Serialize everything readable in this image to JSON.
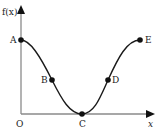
{
  "diagram": {
    "type": "function-graph",
    "y_axis_label": "f(x)",
    "x_axis_label": "x",
    "origin_label": "O",
    "curve_color": "#1a1a1a",
    "axis_color": "#777777",
    "points": [
      {
        "label": "A",
        "description": "maximum on y-axis"
      },
      {
        "label": "B",
        "description": "inflection point (decreasing)"
      },
      {
        "label": "C",
        "description": "minimum on x-axis"
      },
      {
        "label": "D",
        "description": "inflection point (increasing)"
      },
      {
        "label": "E",
        "description": "maximum at right end"
      }
    ]
  }
}
